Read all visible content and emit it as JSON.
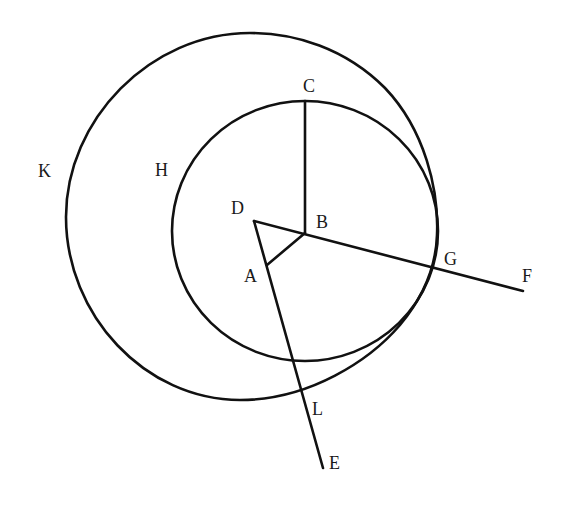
{
  "figure": {
    "type": "geometric-construction",
    "colors": {
      "stroke": "#111111",
      "label": "#1a1a1a",
      "background": "#ffffff"
    },
    "circles": [
      {
        "name": "H",
        "center": "B",
        "cx": 305,
        "cy": 232,
        "r": 132
      },
      {
        "name": "K",
        "description": "larger enclosing circle, internally tangent near G"
      }
    ],
    "points": {
      "A": [
        267,
        265
      ],
      "B": [
        305,
        233
      ],
      "C": [
        305,
        101
      ],
      "D": [
        254,
        221
      ],
      "E": [
        323,
        468
      ],
      "F": [
        523,
        291
      ],
      "G": [
        433,
        267
      ],
      "H": [
        171,
        232
      ],
      "K": [
        66,
        217
      ],
      "L": [
        302,
        393
      ]
    },
    "segments": [
      "BC",
      "DB",
      "BF",
      "DE",
      "AB"
    ],
    "labels": {
      "A": "A",
      "B": "B",
      "C": "C",
      "D": "D",
      "E": "E",
      "F": "F",
      "G": "G",
      "H": "H",
      "K": "K",
      "L": "L"
    }
  }
}
